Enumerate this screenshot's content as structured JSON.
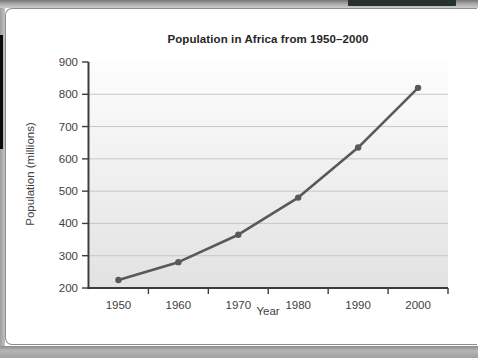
{
  "decor": {
    "top_bar_color": "#a6a6a6",
    "accent_bar_color": "#273130",
    "left_strip_color": "#b0b0b0",
    "black_strip_color": "#0b0b0b",
    "bottom_bar_color": "#a8a8a8",
    "card_bg": "#ffffff",
    "card_border_color": "#8d8d8d"
  },
  "chart_data": {
    "type": "line",
    "title": "Population in Africa from 1950–2000",
    "xlabel": "Year",
    "ylabel": "Population (millions)",
    "x": [
      1950,
      1960,
      1970,
      1980,
      1990,
      2000
    ],
    "values": [
      225,
      280,
      365,
      480,
      635,
      820
    ],
    "ylim": [
      200,
      900
    ],
    "ytick_step": 100,
    "yticks": [
      200,
      300,
      400,
      500,
      600,
      700,
      800,
      900
    ],
    "gridlines_at": [
      300,
      400,
      500,
      600,
      700,
      800
    ],
    "grid": "horizontal",
    "legend": "none",
    "xticks_between_categories": true,
    "series_color": "#58595b",
    "gridline_color": "#c7c7c7",
    "axis_color": "#3d3d3f",
    "label_color": "#3e3e3e",
    "plot_bg_top": "#fdfdfd",
    "plot_bg_bottom": "#e2e2e2"
  }
}
